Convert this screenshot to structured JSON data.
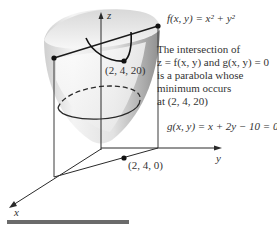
{
  "figure": {
    "function_label": "f(x, y) = x² + y²",
    "constraint_label": "g(x, y) = x + 2y − 10 = 0",
    "caption_lines": [
      "The intersection of",
      "z = f(x, y) and g(x, y) = 0",
      "is a parabola whose",
      "minimum occurs",
      "at (2, 4, 20)"
    ],
    "points": {
      "minimum": "(2, 4, 20)",
      "base": "(2, 4, 0)"
    },
    "axes": {
      "x": "x",
      "y": "y",
      "z": "z"
    }
  },
  "colors": {
    "axis": "#2a2a2a",
    "surface_light": "#f2f2f2",
    "surface_dark": "#9a9a9a",
    "bar": "#6b6b6b"
  }
}
